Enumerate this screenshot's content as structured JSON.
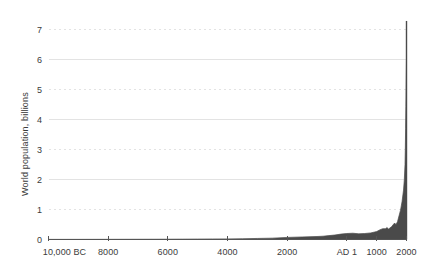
{
  "chart_data": {
    "type": "area",
    "title": "",
    "xlabel": "",
    "ylabel": "World population, billions",
    "xlim": [
      -10000,
      2000
    ],
    "ylim": [
      0,
      7.6
    ],
    "grid": true,
    "legend": null,
    "x_tick_labels": [
      "10,000 BC",
      "8000",
      "6000",
      "4000",
      "2000",
      "AD 1",
      "1000",
      "2000"
    ],
    "x_tick_values": [
      -10000,
      -8000,
      -6000,
      -4000,
      -2000,
      1,
      1000,
      2000
    ],
    "y_tick_labels": [
      "0",
      "1",
      "2",
      "3",
      "4",
      "5",
      "6",
      "7"
    ],
    "y_tick_values": [
      0,
      1,
      2,
      3,
      4,
      5,
      6,
      7
    ],
    "gridline_styles": {
      "0": "none",
      "1": "dashed",
      "2": "solid",
      "3": "dashed",
      "4": "solid",
      "5": "dashed",
      "6": "solid",
      "7": "dashed"
    },
    "series_name": "World population",
    "x": [
      -10000,
      -9500,
      -9000,
      -8500,
      -8000,
      -7500,
      -7000,
      -6500,
      -6000,
      -5500,
      -5000,
      -4500,
      -4000,
      -3500,
      -3000,
      -2500,
      -2000,
      -1500,
      -1000,
      -800,
      -600,
      -400,
      -200,
      1,
      200,
      400,
      600,
      800,
      1000,
      1100,
      1200,
      1300,
      1340,
      1400,
      1500,
      1600,
      1650,
      1700,
      1750,
      1800,
      1850,
      1900,
      1927,
      1950,
      1960,
      1970,
      1980,
      1990,
      1999,
      2000
    ],
    "values": [
      0.004,
      0.0045,
      0.005,
      0.0055,
      0.006,
      0.007,
      0.008,
      0.009,
      0.01,
      0.012,
      0.015,
      0.018,
      0.02,
      0.025,
      0.035,
      0.045,
      0.07,
      0.085,
      0.1,
      0.11,
      0.13,
      0.15,
      0.18,
      0.2,
      0.21,
      0.19,
      0.2,
      0.22,
      0.265,
      0.32,
      0.36,
      0.36,
      0.4,
      0.35,
      0.43,
      0.55,
      0.5,
      0.6,
      0.79,
      0.98,
      1.26,
      1.65,
      2.0,
      2.5,
      3.0,
      3.7,
      4.44,
      5.32,
      6.0,
      7.3
    ],
    "peak_value": 7.3,
    "area_fill_color": "#4a4a4a",
    "gridline_color": "#e3e3e3",
    "axis_color": "#555555",
    "text_color": "#3b3b3b"
  }
}
